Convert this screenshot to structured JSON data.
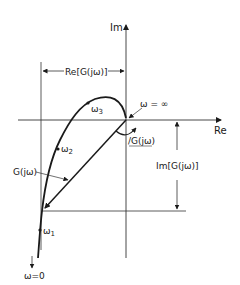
{
  "diagram": {
    "axes": {
      "imag_label": "Im",
      "real_label": "Re"
    },
    "labels": {
      "re_component": "Re[G(jω)]",
      "im_component": "Im[G(jω)]",
      "phase_angle": "/G(jω)",
      "vector": "G(jω)",
      "omega_infinity": "ω = ∞",
      "omega_zero": "ω=0",
      "omega_1": "ω",
      "omega_1_sub": "1",
      "omega_2": "ω",
      "omega_2_sub": "2",
      "omega_3": "ω",
      "omega_3_sub": "3"
    },
    "colors": {
      "ink": "#1a1a1a",
      "thin_line": "#333333",
      "background": "#ffffff"
    }
  }
}
